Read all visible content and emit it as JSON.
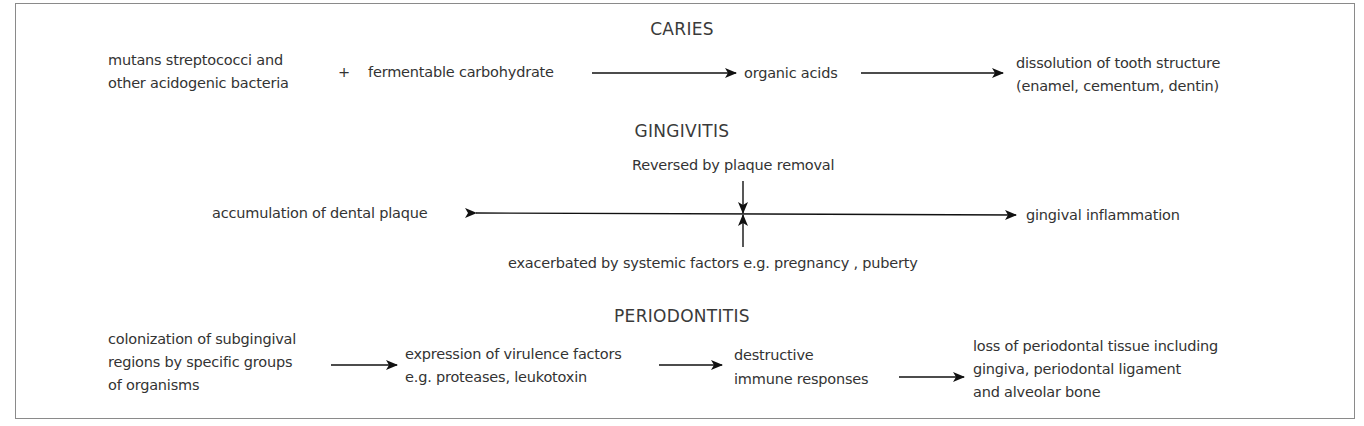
{
  "sections": {
    "caries": {
      "title": "CARIES",
      "bacteria": [
        "mutans streptococci and",
        "other acidogenic bacteria"
      ],
      "plus": "+",
      "substrate": "fermentable carbohydrate",
      "product": "organic acids",
      "outcome": [
        "dissolution of tooth structure",
        "(enamel, cementum, dentin)"
      ]
    },
    "gingivitis": {
      "title": "GINGIVITIS",
      "reversal_note": "Reversed by plaque removal",
      "cause": "accumulation of dental plaque",
      "outcome": "gingival inflammation",
      "exacerbation_note": "exacerbated by systemic factors e.g. pregnancy , puberty"
    },
    "periodontitis": {
      "title": "PERIODONTITIS",
      "step1": [
        "colonization of subgingival",
        "regions by specific groups",
        "of organisms"
      ],
      "step2": [
        "expression of virulence factors",
        "e.g. proteases, leukotoxin"
      ],
      "step3": [
        "destructive",
        "immune responses"
      ],
      "outcome": [
        "loss of periodontal tissue including",
        "gingiva, periodontal ligament",
        "and alveolar bone"
      ]
    }
  },
  "colors": {
    "border": "#8a8a8a",
    "text": "#333333",
    "arrow": "#111111"
  }
}
